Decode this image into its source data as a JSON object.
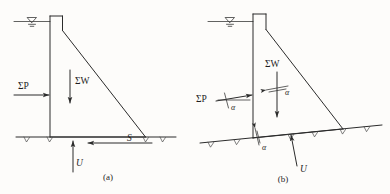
{
  "figure": {
    "name": "dam-stability-force-diagram",
    "background_color": "#fdfcfa",
    "ink_color": "#2b2b2b",
    "panels": [
      {
        "id": "a",
        "caption": "(a)",
        "description": "Gravity dam on horizontal foundation with horizontal water thrust",
        "labels": {
          "water_thrust": "ΣP",
          "weight": "ΣW",
          "uplift": "U",
          "shear": "S"
        },
        "ground": "horizontal"
      },
      {
        "id": "b",
        "caption": "(b)",
        "description": "Gravity dam on inclined foundation, forces resolved at angle alpha",
        "labels": {
          "water_thrust": "ΣP",
          "weight": "ΣW",
          "uplift": "U",
          "angle_base": "α",
          "angle_thrust": "α",
          "angle_weight": "α"
        },
        "ground": "inclined"
      }
    ],
    "symbols": {
      "water_surface": "water-level-triangle",
      "ground_hatch": "ground-hatch-tick"
    }
  }
}
